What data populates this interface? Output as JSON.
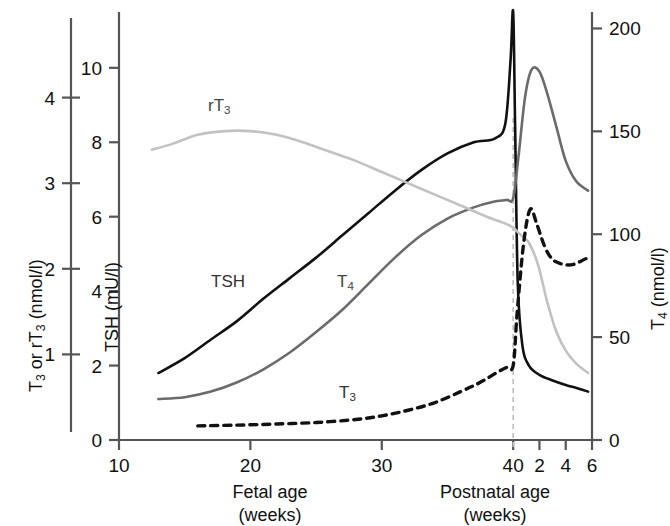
{
  "axes": {
    "left_outer": {
      "title_main": "T",
      "title_sub1": "3",
      "title_mid": " or rT",
      "title_sub2": "3",
      "title_unit": " (nmol/l)",
      "ticks": [
        "1",
        "2",
        "3",
        "4"
      ],
      "values": [
        1,
        2,
        3,
        4
      ],
      "range": [
        0,
        5
      ]
    },
    "left_inner": {
      "title": "TSH (mU/l)",
      "ticks": [
        "0",
        "2",
        "4",
        "6",
        "8",
        "10"
      ],
      "values": [
        0,
        2,
        4,
        6,
        8,
        10
      ],
      "range": [
        0,
        11.5
      ]
    },
    "right": {
      "title_main": "T",
      "title_sub": "4",
      "title_unit": " (nmol/l)",
      "ticks": [
        "0",
        "50",
        "100",
        "150",
        "200"
      ],
      "values": [
        0,
        50,
        100,
        150,
        200
      ],
      "range": [
        0,
        208
      ]
    },
    "x_fetal": {
      "caption_line1": "Fetal age",
      "caption_line2": "(weeks)",
      "ticks": [
        "10",
        "20",
        "30",
        "40"
      ],
      "values": [
        10,
        20,
        30,
        40
      ]
    },
    "x_postnatal": {
      "caption_line1": "Postnatal age",
      "caption_line2": "(weeks)",
      "ticks": [
        "2",
        "4",
        "6"
      ],
      "values": [
        2,
        4,
        6
      ]
    }
  },
  "series_labels": {
    "rt3": {
      "main": "rT",
      "sub": "3"
    },
    "tsh": {
      "main": "TSH",
      "sub": ""
    },
    "t4": {
      "main": "T",
      "sub": "4"
    },
    "t3": {
      "main": "T",
      "sub": "3"
    }
  },
  "colors": {
    "tsh": "#111111",
    "t3": "#111111",
    "t4": "#6b6b6b",
    "rt3": "#c2c2c2",
    "axis": "#555555",
    "birth_line": "#bdbdbd"
  },
  "chart_data": {
    "type": "line",
    "title": "",
    "xlabel": "Fetal age (weeks) / Postnatal age (weeks)",
    "ylabel": "TSH (mU/l)",
    "xlim": [
      10,
      46
    ],
    "birth_marker_x": 40,
    "grid": false,
    "legend": "inline-labels",
    "series": [
      {
        "name": "TSH",
        "axis": "left_inner",
        "unit": "mU/l",
        "style": "solid",
        "color": "#111111",
        "x": [
          13,
          15,
          17,
          19,
          21,
          23,
          25,
          27,
          29,
          31,
          33,
          35,
          37,
          38.6,
          39.4,
          39.8,
          40.0,
          40.15,
          40.35,
          40.7,
          41.2,
          42,
          43,
          44,
          45,
          45.7
        ],
        "y": [
          1.8,
          2.2,
          2.7,
          3.2,
          3.8,
          4.35,
          4.9,
          5.5,
          6.1,
          6.7,
          7.25,
          7.7,
          8.0,
          8.1,
          8.5,
          10.2,
          11.5,
          8.4,
          4.2,
          2.55,
          2.0,
          1.75,
          1.6,
          1.48,
          1.38,
          1.3
        ]
      },
      {
        "name": "T4",
        "axis": "left_inner",
        "unit": "nmol/l (right axis)",
        "style": "solid",
        "color": "#6b6b6b",
        "x": [
          13,
          15,
          17,
          19,
          21,
          23,
          25,
          27,
          29,
          31,
          33,
          35,
          37,
          38.5,
          39.5,
          40,
          40.4,
          40.9,
          41.4,
          42,
          42.6,
          43.3,
          44,
          44.8,
          45.7
        ],
        "y": [
          1.1,
          1.15,
          1.3,
          1.55,
          1.9,
          2.35,
          2.9,
          3.5,
          4.2,
          4.9,
          5.5,
          5.95,
          6.25,
          6.4,
          6.45,
          6.5,
          7.6,
          9.2,
          9.95,
          9.9,
          9.3,
          8.4,
          7.5,
          6.95,
          6.7
        ]
      },
      {
        "name": "rT3",
        "axis": "left_inner",
        "unit": "nmol/l (left outer axis)",
        "style": "solid",
        "color": "#c2c2c2",
        "x": [
          12.5,
          14,
          16,
          18,
          20,
          22,
          24,
          26,
          28,
          30,
          32,
          34,
          36,
          38,
          39.5,
          40,
          40.6,
          41.2,
          41.9,
          42.6,
          43.3,
          44,
          44.8,
          45.7
        ],
        "y": [
          7.8,
          7.95,
          8.2,
          8.3,
          8.3,
          8.2,
          8.0,
          7.75,
          7.5,
          7.2,
          6.9,
          6.6,
          6.3,
          6.0,
          5.8,
          5.7,
          5.5,
          5.3,
          4.7,
          3.7,
          2.9,
          2.4,
          2.05,
          1.8
        ]
      },
      {
        "name": "T3",
        "axis": "left_inner",
        "unit": "nmol/l (left outer axis)",
        "style": "dashed",
        "color": "#111111",
        "x": [
          16,
          19,
          22,
          25,
          28,
          30,
          32,
          34,
          36,
          37.5,
          38.7,
          39.5,
          40,
          40.3,
          40.8,
          41.3,
          41.8,
          42.4,
          43,
          43.8,
          44.6,
          45.4,
          45.8
        ],
        "y": [
          0.38,
          0.4,
          0.43,
          0.47,
          0.55,
          0.65,
          0.8,
          1.0,
          1.3,
          1.55,
          1.8,
          1.95,
          2.0,
          3.4,
          5.3,
          6.2,
          5.8,
          5.2,
          4.85,
          4.72,
          4.72,
          4.85,
          4.9
        ]
      }
    ]
  }
}
